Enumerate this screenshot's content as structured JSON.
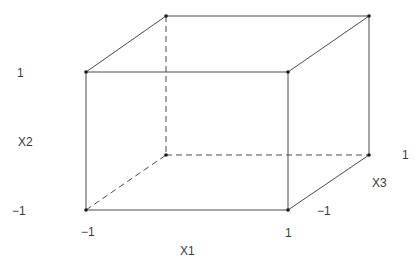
{
  "diagram": {
    "line_color": "#4a4a4a",
    "dot_color": "#1a1a1a",
    "label_color": "#3a3a3a",
    "vertices": {
      "front_top_left": {
        "x": 86,
        "y": 72,
        "coords": [
          -1,
          1,
          -1
        ]
      },
      "front_top_right": {
        "x": 288,
        "y": 72,
        "coords": [
          1,
          1,
          -1
        ]
      },
      "front_bottom_left": {
        "x": 86,
        "y": 210,
        "coords": [
          -1,
          -1,
          -1
        ]
      },
      "front_bottom_right": {
        "x": 288,
        "y": 210,
        "coords": [
          1,
          -1,
          -1
        ]
      },
      "back_top_left": {
        "x": 166,
        "y": 16,
        "coords": [
          -1,
          1,
          1
        ]
      },
      "back_top_right": {
        "x": 369,
        "y": 16,
        "coords": [
          1,
          1,
          1
        ]
      },
      "back_bottom_left": {
        "x": 166,
        "y": 155,
        "coords": [
          -1,
          -1,
          1
        ]
      },
      "back_bottom_right": {
        "x": 369,
        "y": 155,
        "coords": [
          1,
          -1,
          1
        ]
      }
    },
    "edges": [
      {
        "from": "front_top_left",
        "to": "front_top_right",
        "style": "solid"
      },
      {
        "from": "front_top_left",
        "to": "front_bottom_left",
        "style": "solid"
      },
      {
        "from": "front_top_right",
        "to": "front_bottom_right",
        "style": "solid"
      },
      {
        "from": "front_bottom_left",
        "to": "front_bottom_right",
        "style": "solid"
      },
      {
        "from": "back_top_left",
        "to": "back_top_right",
        "style": "solid"
      },
      {
        "from": "back_top_right",
        "to": "back_bottom_right",
        "style": "solid"
      },
      {
        "from": "front_top_left",
        "to": "back_top_left",
        "style": "solid"
      },
      {
        "from": "front_top_right",
        "to": "back_top_right",
        "style": "solid"
      },
      {
        "from": "front_bottom_right",
        "to": "back_bottom_right",
        "style": "solid"
      },
      {
        "from": "back_top_left",
        "to": "back_bottom_left",
        "style": "dashed"
      },
      {
        "from": "back_bottom_left",
        "to": "back_bottom_right",
        "style": "dashed"
      },
      {
        "from": "front_bottom_left",
        "to": "back_bottom_left",
        "style": "dashed"
      }
    ],
    "labels": {
      "x2_high": {
        "text": "1",
        "x": 17,
        "y": 77
      },
      "x2_axis": {
        "text": "X2",
        "x": 18,
        "y": 146
      },
      "x2_low": {
        "text": "−1",
        "x": 12,
        "y": 215
      },
      "x1_low": {
        "text": "−1",
        "x": 81,
        "y": 236
      },
      "x1_high": {
        "text": "1",
        "x": 285,
        "y": 237
      },
      "x1_axis": {
        "text": "X1",
        "x": 180,
        "y": 255
      },
      "x3_low": {
        "text": "−1",
        "x": 317,
        "y": 215
      },
      "x3_axis": {
        "text": "X3",
        "x": 372,
        "y": 187
      },
      "x3_high": {
        "text": "1",
        "x": 402,
        "y": 159
      }
    }
  }
}
